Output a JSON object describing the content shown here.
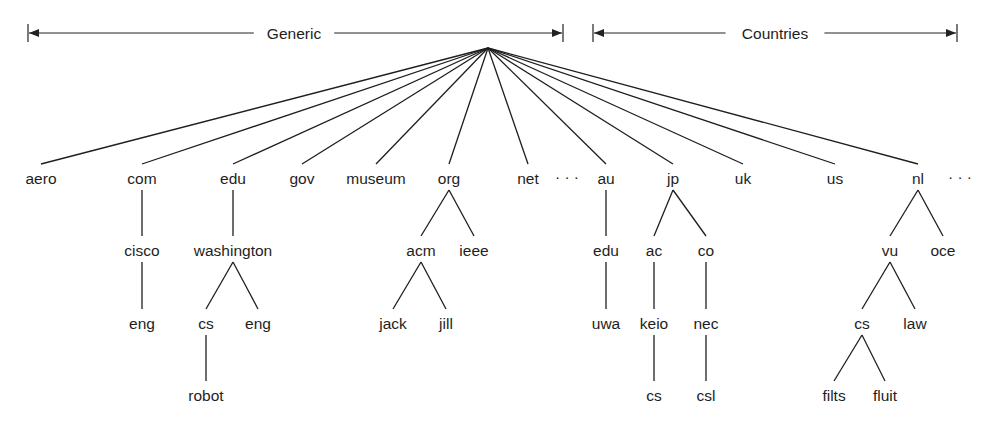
{
  "diagram": {
    "colors": {
      "ink": "#1e1e1e",
      "background": "#ffffff"
    },
    "root": {
      "x": 488,
      "y": 48
    },
    "brackets": [
      {
        "id": "generic",
        "label": "Generic",
        "x1": 28,
        "x2": 563,
        "y": 33,
        "label_x": 294
      },
      {
        "id": "countries",
        "label": "Countries",
        "x1": 593,
        "x2": 957,
        "y": 33,
        "label_x": 775
      }
    ],
    "ellipses": [
      {
        "id": "ellipsis-generic",
        "text": "· · ·",
        "x": 567,
        "y": 178
      },
      {
        "id": "ellipsis-countries",
        "text": "· · ·",
        "x": 960,
        "y": 178
      }
    ],
    "nodes": [
      {
        "id": "aero",
        "label": "aero",
        "x": 41,
        "y": 178,
        "parent": "root",
        "group": "generic"
      },
      {
        "id": "com",
        "label": "com",
        "x": 142,
        "y": 178,
        "parent": "root",
        "group": "generic"
      },
      {
        "id": "edu",
        "label": "edu",
        "x": 233,
        "y": 178,
        "parent": "root",
        "group": "generic"
      },
      {
        "id": "gov",
        "label": "gov",
        "x": 302,
        "y": 178,
        "parent": "root",
        "group": "generic"
      },
      {
        "id": "museum",
        "label": "museum",
        "x": 376,
        "y": 178,
        "parent": "root",
        "group": "generic"
      },
      {
        "id": "org",
        "label": "org",
        "x": 449,
        "y": 178,
        "parent": "root",
        "group": "generic"
      },
      {
        "id": "net",
        "label": "net",
        "x": 528,
        "y": 178,
        "parent": "root",
        "group": "generic"
      },
      {
        "id": "au",
        "label": "au",
        "x": 606,
        "y": 178,
        "parent": "root",
        "group": "countries"
      },
      {
        "id": "jp",
        "label": "jp",
        "x": 673,
        "y": 178,
        "parent": "root",
        "group": "countries"
      },
      {
        "id": "uk",
        "label": "uk",
        "x": 743,
        "y": 178,
        "parent": "root",
        "group": "countries"
      },
      {
        "id": "us",
        "label": "us",
        "x": 835,
        "y": 178,
        "parent": "root",
        "group": "countries"
      },
      {
        "id": "nl",
        "label": "nl",
        "x": 918,
        "y": 178,
        "parent": "root",
        "group": "countries"
      },
      {
        "id": "com-cisco",
        "label": "cisco",
        "x": 142,
        "y": 250,
        "parent": "com"
      },
      {
        "id": "com-cisco-eng",
        "label": "eng",
        "x": 142,
        "y": 323,
        "parent": "com-cisco"
      },
      {
        "id": "edu-washington",
        "label": "washington",
        "x": 233,
        "y": 250,
        "parent": "edu"
      },
      {
        "id": "edu-washington-cs",
        "label": "cs",
        "x": 206,
        "y": 323,
        "parent": "edu-washington"
      },
      {
        "id": "edu-washington-eng",
        "label": "eng",
        "x": 258,
        "y": 323,
        "parent": "edu-washington"
      },
      {
        "id": "edu-washington-cs-robot",
        "label": "robot",
        "x": 206,
        "y": 395,
        "parent": "edu-washington-cs"
      },
      {
        "id": "org-acm",
        "label": "acm",
        "x": 421,
        "y": 250,
        "parent": "org"
      },
      {
        "id": "org-ieee",
        "label": "ieee",
        "x": 474,
        "y": 250,
        "parent": "org"
      },
      {
        "id": "org-acm-jack",
        "label": "jack",
        "x": 393,
        "y": 323,
        "parent": "org-acm"
      },
      {
        "id": "org-acm-jill",
        "label": "jill",
        "x": 446,
        "y": 323,
        "parent": "org-acm"
      },
      {
        "id": "au-edu",
        "label": "edu",
        "x": 606,
        "y": 250,
        "parent": "au"
      },
      {
        "id": "au-edu-uwa",
        "label": "uwa",
        "x": 606,
        "y": 323,
        "parent": "au-edu"
      },
      {
        "id": "jp-ac",
        "label": "ac",
        "x": 654,
        "y": 250,
        "parent": "jp"
      },
      {
        "id": "jp-co",
        "label": "co",
        "x": 706,
        "y": 250,
        "parent": "jp"
      },
      {
        "id": "jp-ac-keio",
        "label": "keio",
        "x": 654,
        "y": 323,
        "parent": "jp-ac"
      },
      {
        "id": "jp-co-nec",
        "label": "nec",
        "x": 706,
        "y": 323,
        "parent": "jp-co"
      },
      {
        "id": "jp-ac-keio-cs",
        "label": "cs",
        "x": 654,
        "y": 395,
        "parent": "jp-ac-keio"
      },
      {
        "id": "jp-co-nec-csl",
        "label": "csl",
        "x": 706,
        "y": 395,
        "parent": "jp-co-nec"
      },
      {
        "id": "nl-vu",
        "label": "vu",
        "x": 890,
        "y": 250,
        "parent": "nl"
      },
      {
        "id": "nl-oce",
        "label": "oce",
        "x": 943,
        "y": 250,
        "parent": "nl"
      },
      {
        "id": "nl-vu-cs",
        "label": "cs",
        "x": 862,
        "y": 323,
        "parent": "nl-vu"
      },
      {
        "id": "nl-vu-law",
        "label": "law",
        "x": 915,
        "y": 323,
        "parent": "nl-vu"
      },
      {
        "id": "nl-vu-cs-filts",
        "label": "filts",
        "x": 834,
        "y": 395,
        "parent": "nl-vu-cs"
      },
      {
        "id": "nl-vu-cs-fluit",
        "label": "fluit",
        "x": 885,
        "y": 395,
        "parent": "nl-vu-cs"
      }
    ]
  }
}
